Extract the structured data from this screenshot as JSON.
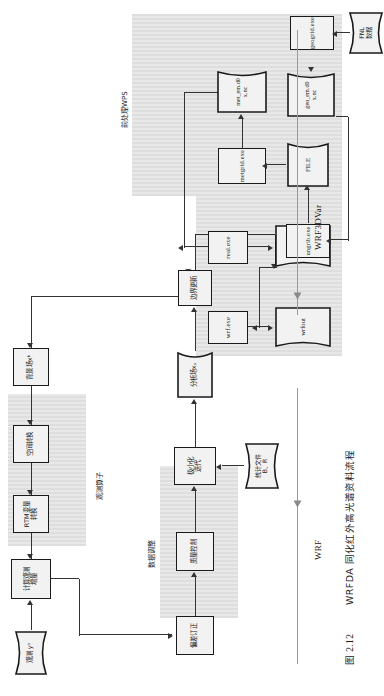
{
  "figure": {
    "caption_number": "图 2.12",
    "caption_text": "WRFDA 同化红外高光谱资料流程",
    "stage_labels": {
      "wrf3dvar": "WRF3DVar",
      "wrf": "WRF"
    },
    "group_labels": {
      "obs_operator": "观测算子",
      "data_adjust": "数据调整",
      "model_run": "模式计算",
      "preprocess_wps": "前处理WPS"
    }
  },
  "nodes": {
    "observation": "观测 yᵒ",
    "calc_innovation": "计算观测\n增量",
    "rtm_convert": "RTM变量\n转换",
    "space_convert": "空间转换",
    "background": "背景场xᵇ",
    "bias_correct": "偏差订正",
    "quality_control": "质量控制",
    "stats_file": "统计文件\nB、R",
    "minimization": "极小化\n迭代",
    "analysis_field": "分析场xₐ",
    "boundary_update": "边界更新",
    "wrf_exe": "wrf.exe",
    "wrfout": "wrfout",
    "real_exe": "real.exe",
    "wrfinput_wrfbdy": "wrfinput\nwrfbdy",
    "geogrid_exe": "geogrid.exe",
    "geo_em": "geo_em.d0\nx.nc",
    "ungrib_exe": "ungrib.exe",
    "file": "FILE",
    "metgrid_exe": "metgrid.exe",
    "met_em": "met_em.d0\nx.nc",
    "fnl_data": "FNL\n数据"
  },
  "colors": {
    "panel": "#e3e3e3",
    "node_fill": "#f2f2f2",
    "stroke": "#1a1a1a",
    "connector": "#333333"
  }
}
